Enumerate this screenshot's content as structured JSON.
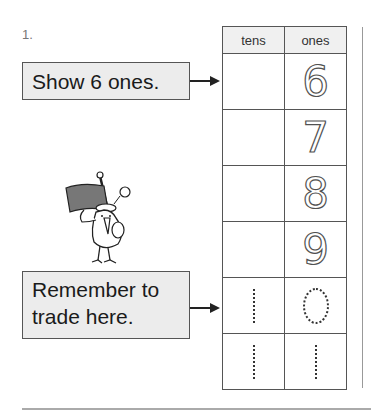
{
  "problem": {
    "number": "1."
  },
  "callouts": [
    {
      "text": "Show 6 ones."
    },
    {
      "line1": "Remember to",
      "line2": "trade here."
    }
  ],
  "table": {
    "headers": [
      "tens",
      "ones"
    ],
    "rows": [
      {
        "tens": "",
        "ones": "6"
      },
      {
        "tens": "",
        "ones": "7"
      },
      {
        "tens": "",
        "ones": "8"
      },
      {
        "tens": "",
        "ones": "9"
      },
      {
        "tens": "1",
        "ones": "0"
      },
      {
        "tens": "1",
        "ones": "1"
      }
    ]
  },
  "illustration": {
    "subject": "bird-with-flag"
  }
}
